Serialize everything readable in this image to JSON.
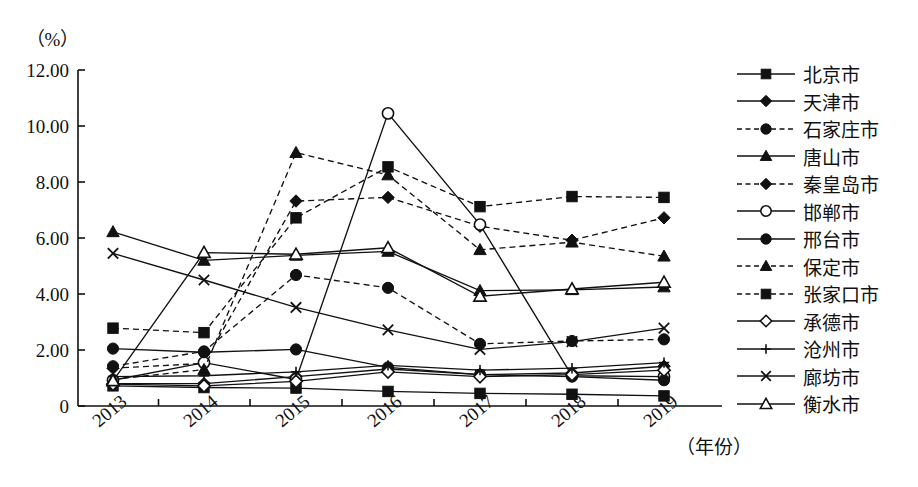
{
  "axes": {
    "y_unit_label": "（%）",
    "x_unit_label": "（年份）",
    "y_ticks": [
      "0",
      "2.00",
      "4.00",
      "6.00",
      "8.00",
      "10.00",
      "12.00"
    ],
    "x_ticks": [
      "2013",
      "2014",
      "2015",
      "2016",
      "2017",
      "2018",
      "2019"
    ]
  },
  "legend": {
    "items": [
      {
        "label": "北京市",
        "marker": "square-filled",
        "dash": false
      },
      {
        "label": "天津市",
        "marker": "diamond-filled",
        "dash": false
      },
      {
        "label": "石家庄市",
        "marker": "circle-filled",
        "dash": true
      },
      {
        "label": "唐山市",
        "marker": "triangle-filled",
        "dash": false
      },
      {
        "label": "秦皇岛市",
        "marker": "diamond-filled",
        "dash": true
      },
      {
        "label": "邯郸市",
        "marker": "circle-open",
        "dash": false
      },
      {
        "label": "邢台市",
        "marker": "circle-filled",
        "dash": false
      },
      {
        "label": "保定市",
        "marker": "triangle-filled",
        "dash": true
      },
      {
        "label": "张家口市",
        "marker": "square-filled",
        "dash": true
      },
      {
        "label": "承德市",
        "marker": "diamond-open",
        "dash": false
      },
      {
        "label": "沧州市",
        "marker": "plus",
        "dash": false
      },
      {
        "label": "廊坊市",
        "marker": "cross",
        "dash": false
      },
      {
        "label": "衡水市",
        "marker": "triangle-open",
        "dash": false
      }
    ]
  },
  "chart_data": {
    "type": "line",
    "title": "",
    "xlabel": "（年份）",
    "ylabel": "（%）",
    "x": [
      "2013",
      "2014",
      "2015",
      "2016",
      "2017",
      "2018",
      "2019"
    ],
    "ylim": [
      0,
      12
    ],
    "ytick_step": 2,
    "grid": false,
    "legend_position": "right",
    "series": [
      {
        "name": "北京市",
        "marker": "square-filled",
        "dash": false,
        "values": [
          0.72,
          0.66,
          0.64,
          0.52,
          0.45,
          0.42,
          0.36
        ]
      },
      {
        "name": "天津市",
        "marker": "diamond-filled",
        "dash": false,
        "values": [
          0.8,
          0.8,
          1.05,
          1.32,
          1.12,
          1.18,
          1.42
        ]
      },
      {
        "name": "石家庄市",
        "marker": "circle-filled",
        "dash": true,
        "values": [
          1.42,
          1.95,
          4.68,
          4.22,
          2.22,
          2.32,
          2.38
        ]
      },
      {
        "name": "唐山市",
        "marker": "triangle-filled",
        "dash": false,
        "values": [
          6.22,
          5.2,
          5.38,
          5.52,
          4.12,
          4.15,
          4.25
        ]
      },
      {
        "name": "秦皇岛市",
        "marker": "diamond-filled",
        "dash": true,
        "values": [
          1.35,
          1.52,
          7.32,
          7.45,
          6.42,
          5.92,
          6.72
        ]
      },
      {
        "name": "邯郸市",
        "marker": "circle-open",
        "dash": false,
        "values": [
          0.92,
          1.55,
          0.95,
          10.45,
          6.48,
          1.08,
          1.05
        ]
      },
      {
        "name": "邢台市",
        "marker": "circle-filled",
        "dash": false,
        "values": [
          2.05,
          1.92,
          2.02,
          1.38,
          1.12,
          1.05,
          0.92
        ]
      },
      {
        "name": "保定市",
        "marker": "triangle-filled",
        "dash": true,
        "values": [
          0.95,
          1.3,
          9.05,
          8.25,
          5.58,
          5.85,
          5.35
        ]
      },
      {
        "name": "张家口市",
        "marker": "square-filled",
        "dash": true,
        "values": [
          2.78,
          2.62,
          6.72,
          8.54,
          7.12,
          7.48,
          7.45
        ]
      },
      {
        "name": "承德市",
        "marker": "diamond-open",
        "dash": false,
        "values": [
          0.78,
          0.72,
          0.88,
          1.22,
          1.05,
          1.12,
          1.28
        ]
      },
      {
        "name": "沧州市",
        "marker": "plus",
        "dash": false,
        "values": [
          1.05,
          1.08,
          1.22,
          1.45,
          1.28,
          1.35,
          1.55
        ]
      },
      {
        "name": "廊坊市",
        "marker": "cross",
        "dash": false,
        "values": [
          5.45,
          4.5,
          3.52,
          2.72,
          2.02,
          2.3,
          2.78
        ]
      },
      {
        "name": "衡水市",
        "marker": "triangle-open",
        "dash": false,
        "values": [
          0.9,
          5.48,
          5.42,
          5.65,
          3.92,
          4.18,
          4.42
        ]
      }
    ]
  }
}
